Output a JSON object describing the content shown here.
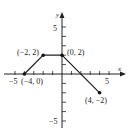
{
  "chart_data": {
    "type": "line",
    "title": "",
    "xlabel": "x",
    "ylabel": "y",
    "xlim": [
      -5,
      5
    ],
    "ylim": [
      -5,
      5
    ],
    "grid": false,
    "x_tick_labels": [
      "-5",
      "5"
    ],
    "y_tick_labels": [
      "5",
      "-5"
    ],
    "series": [
      {
        "name": "piecewise",
        "points": [
          [
            -4,
            0
          ],
          [
            -2,
            2
          ],
          [
            0,
            2
          ],
          [
            4,
            -2
          ]
        ]
      }
    ],
    "point_labels": [
      "(-4, 0)",
      "(-2, 2)",
      "(0, 2)",
      "(4, -2)"
    ],
    "header_text_cropped": "g(x) = ... f(x ...)"
  }
}
